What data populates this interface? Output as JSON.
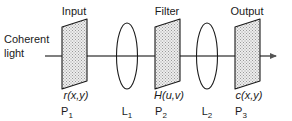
{
  "diagram": {
    "source_label_line1": "Coherent",
    "source_label_line2": "light",
    "axis": {
      "name": "optical-axis",
      "arrow": "right-arrow",
      "color": "#555555"
    },
    "colors": {
      "stroke": "#1a1a1a",
      "axis": "#555555",
      "plane_fill": "#e2e2e2",
      "text": "#1a1a1a",
      "background": "#ffffff"
    },
    "stages": [
      {
        "id": "p1",
        "kind": "plane",
        "top_label": "Input",
        "function_label": "r(x,y)",
        "plane_label": "P",
        "plane_subscript": "1",
        "icon": "hatched-plane-icon",
        "cx": 74
      },
      {
        "id": "l1",
        "kind": "lens",
        "top_label": "",
        "function_label": "",
        "plane_label": "L",
        "plane_subscript": "1",
        "icon": "lens-icon",
        "cx": 127
      },
      {
        "id": "p2",
        "kind": "plane",
        "top_label": "Filter",
        "function_label": "H(u,v)",
        "plane_label": "P",
        "plane_subscript": "2",
        "icon": "hatched-plane-icon",
        "cx": 167
      },
      {
        "id": "l2",
        "kind": "lens",
        "top_label": "",
        "function_label": "",
        "plane_label": "L",
        "plane_subscript": "2",
        "icon": "lens-icon",
        "cx": 207
      },
      {
        "id": "p3",
        "kind": "plane",
        "top_label": "Output",
        "function_label": "c(x,y)",
        "plane_label": "P",
        "plane_subscript": "3",
        "icon": "hatched-plane-icon",
        "cx": 247
      }
    ]
  }
}
